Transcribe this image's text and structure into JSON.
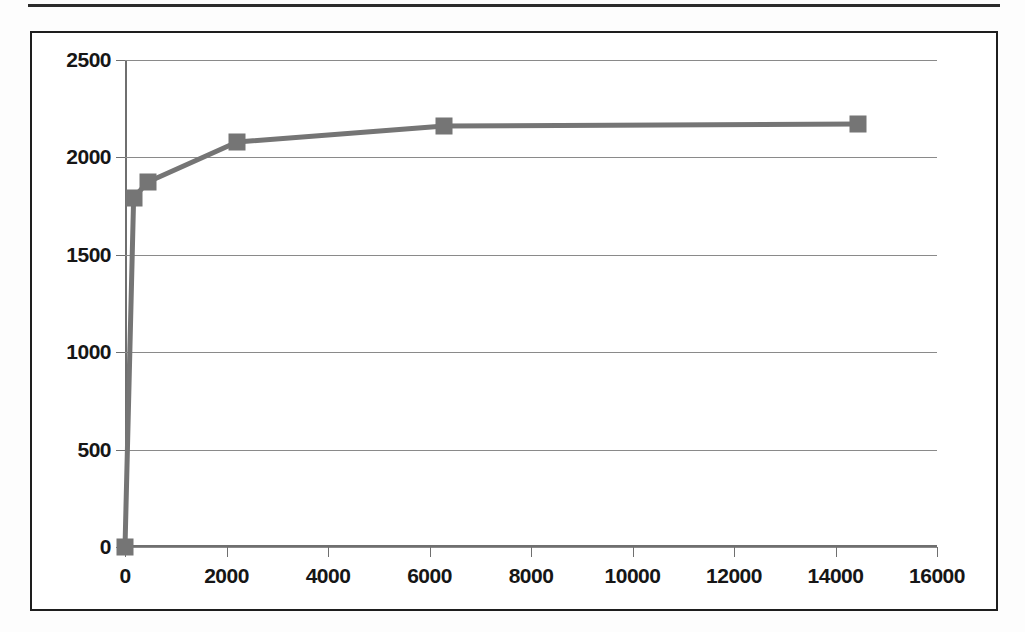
{
  "document": {
    "type": "scanned-figure-page",
    "top_rule_visible": true
  },
  "chart_data": {
    "type": "line",
    "title": "",
    "subtitle": "",
    "xlabel": "",
    "ylabel": "",
    "xlim": [
      0,
      16000
    ],
    "ylim": [
      0,
      2500
    ],
    "xticks": [
      0,
      2000,
      4000,
      6000,
      8000,
      10000,
      12000,
      14000,
      16000
    ],
    "yticks": [
      0,
      500,
      1000,
      1500,
      2000,
      2500
    ],
    "xtick_labels": [
      "0",
      "2000",
      "4000",
      "6000",
      "8000",
      "10000",
      "12000",
      "14000",
      "16000"
    ],
    "ytick_labels": [
      "0",
      "500",
      "1000",
      "1500",
      "2000",
      "2500"
    ],
    "grid": {
      "horizontal": true,
      "vertical": false
    },
    "legend": {
      "visible": false,
      "position": "none"
    },
    "series": [
      {
        "name": "series-1",
        "color": "#757575",
        "marker": "square",
        "x": [
          0,
          170,
          450,
          2210,
          6290,
          14440
        ],
        "values": [
          0,
          1792,
          1874,
          2079,
          2161,
          2171
        ],
        "points": [
          {
            "x": 0,
            "y": 0
          },
          {
            "x": 170,
            "y": 1792
          },
          {
            "x": 450,
            "y": 1874
          },
          {
            "x": 2210,
            "y": 2079
          },
          {
            "x": 6290,
            "y": 2161
          },
          {
            "x": 14440,
            "y": 2171
          }
        ]
      }
    ],
    "colors": {
      "series": "#757575",
      "gridline": "#8a8a8a",
      "axis": "#6f6f6f",
      "frame": "#1e1e1e",
      "tick_text": "#161616",
      "background": "#ffffff"
    }
  }
}
